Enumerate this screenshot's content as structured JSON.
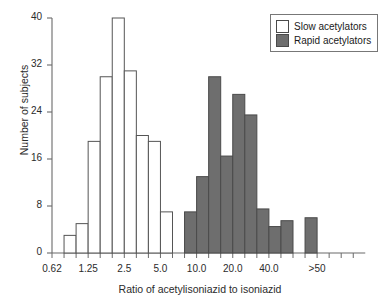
{
  "chart_data": {
    "type": "bar",
    "title": "",
    "subtitle": "",
    "xlabel": "Ratio of acetylisoniazid to isoniazid",
    "ylabel": "Number of subjects",
    "xscale": "log",
    "ylim": [
      0,
      40
    ],
    "yticks": [
      0,
      8,
      16,
      24,
      32,
      40
    ],
    "xtick_labels": [
      "0.62",
      "1.25",
      "2.5",
      "5.0",
      "10.0",
      "20.0",
      "40.0",
      ">50"
    ],
    "grid": false,
    "legend_position": "top-right",
    "bin_count": 25,
    "series": [
      {
        "name": "Slow acetylators",
        "color": "#ffffff",
        "edge_color": "#555555",
        "bins": [
          {
            "index": 0,
            "value": 0
          },
          {
            "index": 1,
            "value": 3
          },
          {
            "index": 2,
            "value": 5
          },
          {
            "index": 3,
            "value": 19
          },
          {
            "index": 4,
            "value": 30
          },
          {
            "index": 5,
            "value": 40
          },
          {
            "index": 6,
            "value": 31
          },
          {
            "index": 7,
            "value": 20
          },
          {
            "index": 8,
            "value": 19
          },
          {
            "index": 9,
            "value": 7
          },
          {
            "index": 10,
            "value": 0
          }
        ],
        "values": [
          0,
          3,
          5,
          19,
          30,
          40,
          31,
          20,
          19,
          7,
          0
        ]
      },
      {
        "name": "Rapid acetylators",
        "color": "#6e6e6e",
        "edge_color": "#4a4a4a",
        "bins": [
          {
            "index": 11,
            "value": 7
          },
          {
            "index": 12,
            "value": 13
          },
          {
            "index": 13,
            "value": 30
          },
          {
            "index": 14,
            "value": 16.5
          },
          {
            "index": 15,
            "value": 27
          },
          {
            "index": 16,
            "value": 23.5
          },
          {
            "index": 17,
            "value": 7.5
          },
          {
            "index": 18,
            "value": 4.5
          },
          {
            "index": 19,
            "value": 5.5
          },
          {
            "index": 20,
            "value": 0
          },
          {
            "index": 21,
            "value": 6
          },
          {
            "index": 22,
            "value": 0
          }
        ],
        "values": [
          7,
          13,
          30,
          16.5,
          27,
          23.5,
          7.5,
          4.5,
          5.5,
          0,
          6,
          0
        ]
      }
    ]
  },
  "legend": {
    "items": [
      {
        "label": "Slow acetylators",
        "swatch": "#ffffff"
      },
      {
        "label": "Rapid acetylators",
        "swatch": "#6e6e6e"
      }
    ]
  }
}
